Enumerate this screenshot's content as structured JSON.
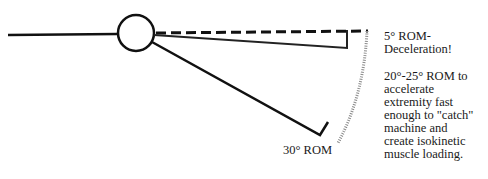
{
  "diagram": {
    "type": "range-of-motion schematic",
    "colors": {
      "line": "#111111",
      "dotted_arc": "#9a9a9a",
      "background": "#ffffff"
    },
    "labels": {
      "five_degree": "5° ROM-\nDeceleration!",
      "twenty_degree": "20°-25° ROM to\naccelerate\nextremity fast\nenough to \"catch\"\nmachine and\ncreate isokinetic\nmuscle loading.",
      "thirty_degree": "30° ROM"
    },
    "elements": [
      {
        "name": "fixed-segment",
        "desc": "horizontal limb segment left of joint"
      },
      {
        "name": "joint",
        "desc": "circle representing joint axis"
      },
      {
        "name": "reference-line",
        "desc": "dashed horizontal line (0° reference)"
      },
      {
        "name": "five-degree-line",
        "desc": "limb position at 5° with stop tick"
      },
      {
        "name": "thirty-degree-line",
        "desc": "limb position at 30° with stop tick"
      },
      {
        "name": "motion-arc",
        "desc": "dotted arc indicating range of motion"
      }
    ]
  }
}
